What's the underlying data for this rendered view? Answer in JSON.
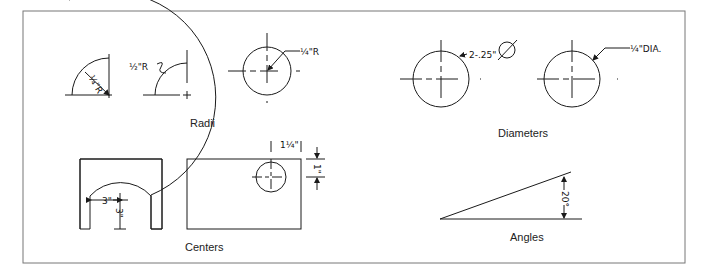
{
  "figure": {
    "captions": {
      "radii": "Radii",
      "diameters": "Diameters",
      "centers": "Centers",
      "angles": "Angles"
    },
    "annotations": {
      "radius_quarter_arc": "¼\"R",
      "radius_half_arc": "½\"R",
      "radius_circle": "¼\"R",
      "diameter_dim": "2-.25\"",
      "diameter_symbol": "⌀",
      "diameter_leader": "¼\"DIA.",
      "center_arch_horizontal": "3\"",
      "center_arch_vertical": "3\"",
      "center_rect_horizontal": "1¼\"",
      "center_rect_vertical": "1\"",
      "angle_value": "20°"
    },
    "colors": {
      "line": "#1a1a1a",
      "frame": "#777777",
      "symbol_highlight": "#4caf50"
    }
  }
}
